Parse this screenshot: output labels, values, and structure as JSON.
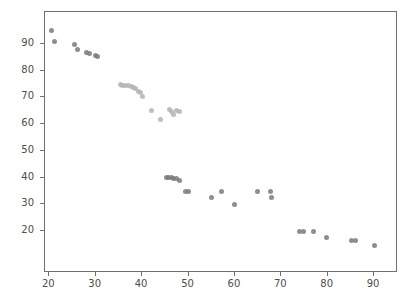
{
  "chart_data": {
    "type": "scatter",
    "title": "",
    "subtitle": "",
    "xlabel": "",
    "ylabel": "",
    "xlim": [
      16,
      94
    ],
    "ylim": [
      11,
      98
    ],
    "xticks": [
      20,
      30,
      40,
      50,
      60,
      70,
      80,
      90
    ],
    "yticks": [
      20,
      30,
      40,
      50,
      60,
      70,
      80,
      90
    ],
    "grid": false,
    "legend": null,
    "marker": {
      "shape": "circle",
      "size_px": 5,
      "color_dark": "#7a7a7a",
      "color_light": "#b4b4b4",
      "opacity": 0.85
    },
    "series": [
      {
        "name": "series-1",
        "color": "#7a7a7a",
        "points": [
          {
            "x": 20.6,
            "y": 94.6
          },
          {
            "x": 21.4,
            "y": 90.7
          },
          {
            "x": 25.6,
            "y": 89.5
          },
          {
            "x": 26.4,
            "y": 87.6
          },
          {
            "x": 28.2,
            "y": 86.3
          },
          {
            "x": 28.8,
            "y": 85.9
          },
          {
            "x": 30.1,
            "y": 85.4
          },
          {
            "x": 30.5,
            "y": 85.0
          },
          {
            "x": 45.5,
            "y": 39.7
          },
          {
            "x": 46.0,
            "y": 39.5
          },
          {
            "x": 46.5,
            "y": 39.6
          },
          {
            "x": 47.0,
            "y": 39.4
          },
          {
            "x": 47.6,
            "y": 39.3
          },
          {
            "x": 48.3,
            "y": 38.5
          },
          {
            "x": 49.5,
            "y": 34.4
          },
          {
            "x": 50.2,
            "y": 34.4
          },
          {
            "x": 55.2,
            "y": 32.3
          },
          {
            "x": 57.3,
            "y": 34.3
          },
          {
            "x": 60.1,
            "y": 29.4
          },
          {
            "x": 65.1,
            "y": 34.3
          },
          {
            "x": 67.9,
            "y": 34.2
          },
          {
            "x": 68.0,
            "y": 32.2
          },
          {
            "x": 74.2,
            "y": 19.3
          },
          {
            "x": 75.1,
            "y": 19.3
          },
          {
            "x": 77.1,
            "y": 19.3
          },
          {
            "x": 80.0,
            "y": 17.0
          },
          {
            "x": 85.3,
            "y": 16.0
          },
          {
            "x": 86.1,
            "y": 16.0
          },
          {
            "x": 90.2,
            "y": 14.0
          }
        ]
      },
      {
        "name": "series-2",
        "color": "#b4b4b4",
        "points": [
          {
            "x": 35.5,
            "y": 74.4
          },
          {
            "x": 36.0,
            "y": 74.2
          },
          {
            "x": 36.6,
            "y": 73.9
          },
          {
            "x": 37.3,
            "y": 74.2
          },
          {
            "x": 37.9,
            "y": 73.6
          },
          {
            "x": 38.4,
            "y": 73.3
          },
          {
            "x": 38.9,
            "y": 72.8
          },
          {
            "x": 39.4,
            "y": 72.0
          },
          {
            "x": 39.9,
            "y": 71.4
          },
          {
            "x": 40.4,
            "y": 70.0
          },
          {
            "x": 42.3,
            "y": 64.6
          },
          {
            "x": 44.2,
            "y": 61.3
          },
          {
            "x": 46.2,
            "y": 65.0
          },
          {
            "x": 46.6,
            "y": 64.2
          },
          {
            "x": 46.9,
            "y": 63.2
          },
          {
            "x": 47.6,
            "y": 64.7
          },
          {
            "x": 48.2,
            "y": 64.3
          }
        ]
      }
    ]
  }
}
